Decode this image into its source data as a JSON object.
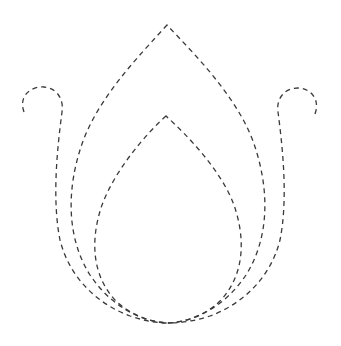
{
  "figure": {
    "subject": "Lotus / flame outline made of dashed lines",
    "background_color": "#ffffff",
    "stroke_color": "#3a3a3a",
    "line_style": "dashed",
    "parts": [
      {
        "id": "outer-flame",
        "label": "Outer pointed petal",
        "tip": [
          167,
          25
        ],
        "base": [
          168,
          323
        ]
      },
      {
        "id": "inner-flame",
        "label": "Inner pointed petal",
        "tip": [
          166,
          116
        ],
        "base": [
          168,
          323
        ]
      },
      {
        "id": "left-curl",
        "label": "Left curled tendril",
        "curl_top": [
          42,
          87
        ],
        "base": [
          168,
          323
        ]
      },
      {
        "id": "right-curl",
        "label": "Right curled tendril",
        "curl_top": [
          300,
          88
        ],
        "base": [
          168,
          323
        ]
      }
    ]
  }
}
